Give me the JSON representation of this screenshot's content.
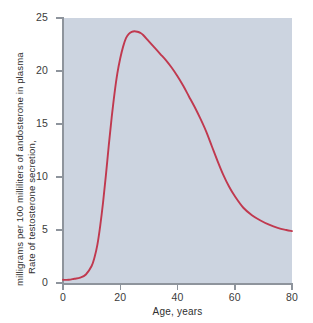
{
  "chart_data": {
    "type": "line",
    "title": "",
    "xlabel": "Age, years",
    "ylabel_line1": "Rate of testosterone secretion,",
    "ylabel_line2": "milligrams per 100 milliliters of andosterone in plasma",
    "xlim": [
      0,
      80
    ],
    "ylim": [
      0,
      25
    ],
    "xticks": [
      0,
      20,
      40,
      60,
      80
    ],
    "yticks": [
      0,
      5,
      10,
      15,
      20,
      25
    ],
    "xticklabels": [
      "0",
      "20",
      "40",
      "60",
      "80"
    ],
    "yticklabels": [
      "0",
      "5",
      "10",
      "15",
      "20",
      "25"
    ],
    "grid": false,
    "legend": false,
    "series": [
      {
        "name": "Testosterone secretion rate",
        "color": "#c0394f",
        "x": [
          0,
          2,
          4,
          6,
          8,
          10,
          11,
          12,
          13,
          14,
          15,
          16,
          17,
          18,
          19,
          20,
          21,
          22,
          23,
          24,
          25,
          26,
          27,
          28,
          30,
          32,
          34,
          36,
          38,
          40,
          42,
          44,
          46,
          48,
          50,
          52,
          54,
          56,
          58,
          60,
          63,
          66,
          69,
          72,
          75,
          78,
          80
        ],
        "y": [
          0.3,
          0.3,
          0.4,
          0.5,
          0.8,
          1.6,
          2.4,
          3.6,
          5.4,
          7.6,
          10.2,
          13.0,
          15.6,
          17.9,
          19.8,
          21.2,
          22.3,
          23.1,
          23.5,
          23.7,
          23.75,
          23.7,
          23.6,
          23.4,
          22.8,
          22.2,
          21.6,
          21.0,
          20.3,
          19.5,
          18.6,
          17.6,
          16.6,
          15.5,
          14.3,
          12.9,
          11.5,
          10.2,
          9.1,
          8.2,
          7.1,
          6.4,
          5.9,
          5.5,
          5.2,
          5.0,
          4.9
        ]
      }
    ]
  },
  "axis_colors": {
    "plot_background": "#ccd4e0",
    "figure_background": "#ffffff",
    "axis_line": "#8e949c",
    "tick_label": "#3b3b3b",
    "curve": "#c0394f"
  }
}
